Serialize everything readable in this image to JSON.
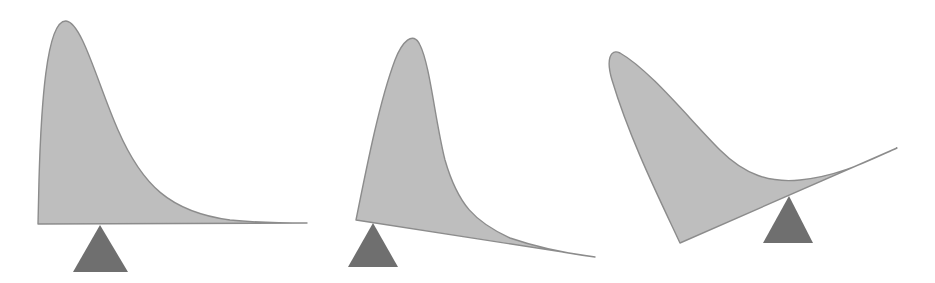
{
  "diagram": {
    "colors": {
      "curve_fill": "#bebebe",
      "curve_stroke": "#8c8c8c",
      "fulcrum_fill": "#6f6f6f",
      "background": "#ffffff"
    },
    "panels": [
      {
        "id": "balanced",
        "curve_path": "M38,224 L39,180 C41,110 46,20 66,21 C82,22 98,85 118,130 C142,185 170,212 230,220 C260,223 285,223 307,223 Z",
        "fulcrum": {
          "apex": [
            100,
            225
          ],
          "base_left": [
            73,
            272
          ],
          "base_right": [
            128,
            272
          ]
        }
      },
      {
        "id": "tilted-right-down",
        "curve_path": "M356,220 C368,160 380,100 395,60 C402,42 413,30 420,45 C430,65 435,120 445,160 C458,205 475,222 510,238 C545,250 570,254 595,257 Z",
        "fulcrum": {
          "apex": [
            373,
            223
          ],
          "base_left": [
            348,
            267
          ],
          "base_right": [
            398,
            267
          ]
        }
      },
      {
        "id": "tilted-right-up",
        "curve_path": "M680,243 C660,200 630,140 612,80 C606,60 610,48 620,53 C650,70 690,120 720,150 C745,175 770,183 800,180 C840,176 870,160 897,148 Z",
        "fulcrum": {
          "apex": [
            789,
            196
          ],
          "base_left": [
            763,
            243
          ],
          "base_right": [
            813,
            243
          ]
        }
      }
    ]
  }
}
